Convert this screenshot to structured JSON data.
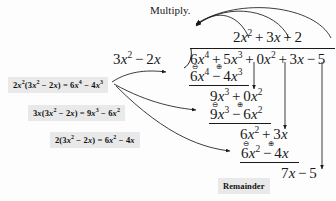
{
  "figure": {
    "title_annotation": "Multiply.",
    "remainder_label": "Remainder",
    "ink_color": "#1a1a1a",
    "callout_bg": "#e9e9e9",
    "background": "#fdfdfd"
  },
  "division": {
    "type": "polynomial-long-division",
    "divisor": "3x² − 2x",
    "dividend": "6x⁴ + 5x³ + 0x² + 3x − 5",
    "quotient": "2x² + 3x + 2",
    "remainder": "7x − 5",
    "steps": [
      {
        "product": "6x⁴ − 4x³",
        "bring_down": "9x³ + 0x²",
        "signs": [
          "⊖",
          "⊕"
        ]
      },
      {
        "product": "9x³ − 6x²",
        "bring_down": "6x² + 3x",
        "signs": [
          "⊖",
          "⊕"
        ]
      },
      {
        "product": "6x² − 4x",
        "bring_down": "7x − 5",
        "signs": [
          "⊖",
          "⊕"
        ]
      }
    ]
  },
  "quotient_terms": {
    "t1_coef": "2",
    "t1_var": "x",
    "t1_exp": "2",
    "op1": "+",
    "t2_coef": "3",
    "t2_var": "x",
    "op2": "+",
    "t3": "2"
  },
  "divisor_expr": {
    "c1": "3",
    "v1": "x",
    "e1": "2",
    "op": "−",
    "c2": "2",
    "v2": "x"
  },
  "dividend_expr": {
    "t1c": "6",
    "t1v": "x",
    "t1e": "4",
    "o1": "+",
    "t2c": "5",
    "t2v": "x",
    "t2e": "3",
    "o2": "+",
    "t3c": "0",
    "t3v": "x",
    "t3e": "2",
    "o3": "+",
    "t4c": "3",
    "t4v": "x",
    "o4": "−",
    "t5": "5"
  },
  "row_prod1": {
    "c1": "6",
    "v1": "x",
    "e1": "4",
    "op": "−",
    "c2": "4",
    "v2": "x",
    "e2": "3"
  },
  "row_bring1": {
    "c1": "9",
    "v1": "x",
    "e1": "3",
    "op": "+",
    "c2": "0",
    "v2": "x",
    "e2": "2"
  },
  "row_prod2": {
    "c1": "9",
    "v1": "x",
    "e1": "3",
    "op": "−",
    "c2": "6",
    "v2": "x",
    "e2": "2"
  },
  "row_bring2": {
    "c1": "6",
    "v1": "x",
    "e1": "2",
    "op": "+",
    "c2": "3",
    "v2": "x"
  },
  "row_prod3": {
    "c1": "6",
    "v1": "x",
    "e1": "2",
    "op": "−",
    "c2": "4",
    "v2": "x"
  },
  "row_remainder": {
    "c1": "7",
    "v1": "x",
    "op": "−",
    "c2": "5"
  },
  "callouts": [
    {
      "id": "callout-step-1",
      "coef": "2",
      "coef_var": "x",
      "coef_exp": "2",
      "lp": "(",
      "d1": "3",
      "dv1": "x",
      "de1": "2",
      "dop": "−",
      "d2": "2",
      "dv2": "x",
      "rp": ")",
      "eq": "=",
      "r1": "6",
      "rv1": "x",
      "re1": "4",
      "rop": "−",
      "r2": "4",
      "rv2": "x",
      "re2": "3"
    },
    {
      "id": "callout-step-2",
      "coef": "3",
      "coef_var": "x",
      "coef_exp": "",
      "lp": "(",
      "d1": "3",
      "dv1": "x",
      "de1": "2",
      "dop": "−",
      "d2": "2",
      "dv2": "x",
      "rp": ")",
      "eq": "=",
      "r1": "9",
      "rv1": "x",
      "re1": "3",
      "rop": "−",
      "r2": "6",
      "rv2": "x",
      "re2": "2"
    },
    {
      "id": "callout-step-3",
      "coef": "2",
      "coef_var": "",
      "coef_exp": "",
      "lp": "(",
      "d1": "3",
      "dv1": "x",
      "de1": "2",
      "dop": "−",
      "d2": "2",
      "dv2": "x",
      "rp": ")",
      "eq": "=",
      "r1": "6",
      "rv1": "x",
      "re1": "2",
      "rop": "−",
      "r2": "4",
      "rv2": "x",
      "re2": ""
    }
  ],
  "signs": {
    "minus_circle": "⊖",
    "plus_circle": "⊕"
  }
}
